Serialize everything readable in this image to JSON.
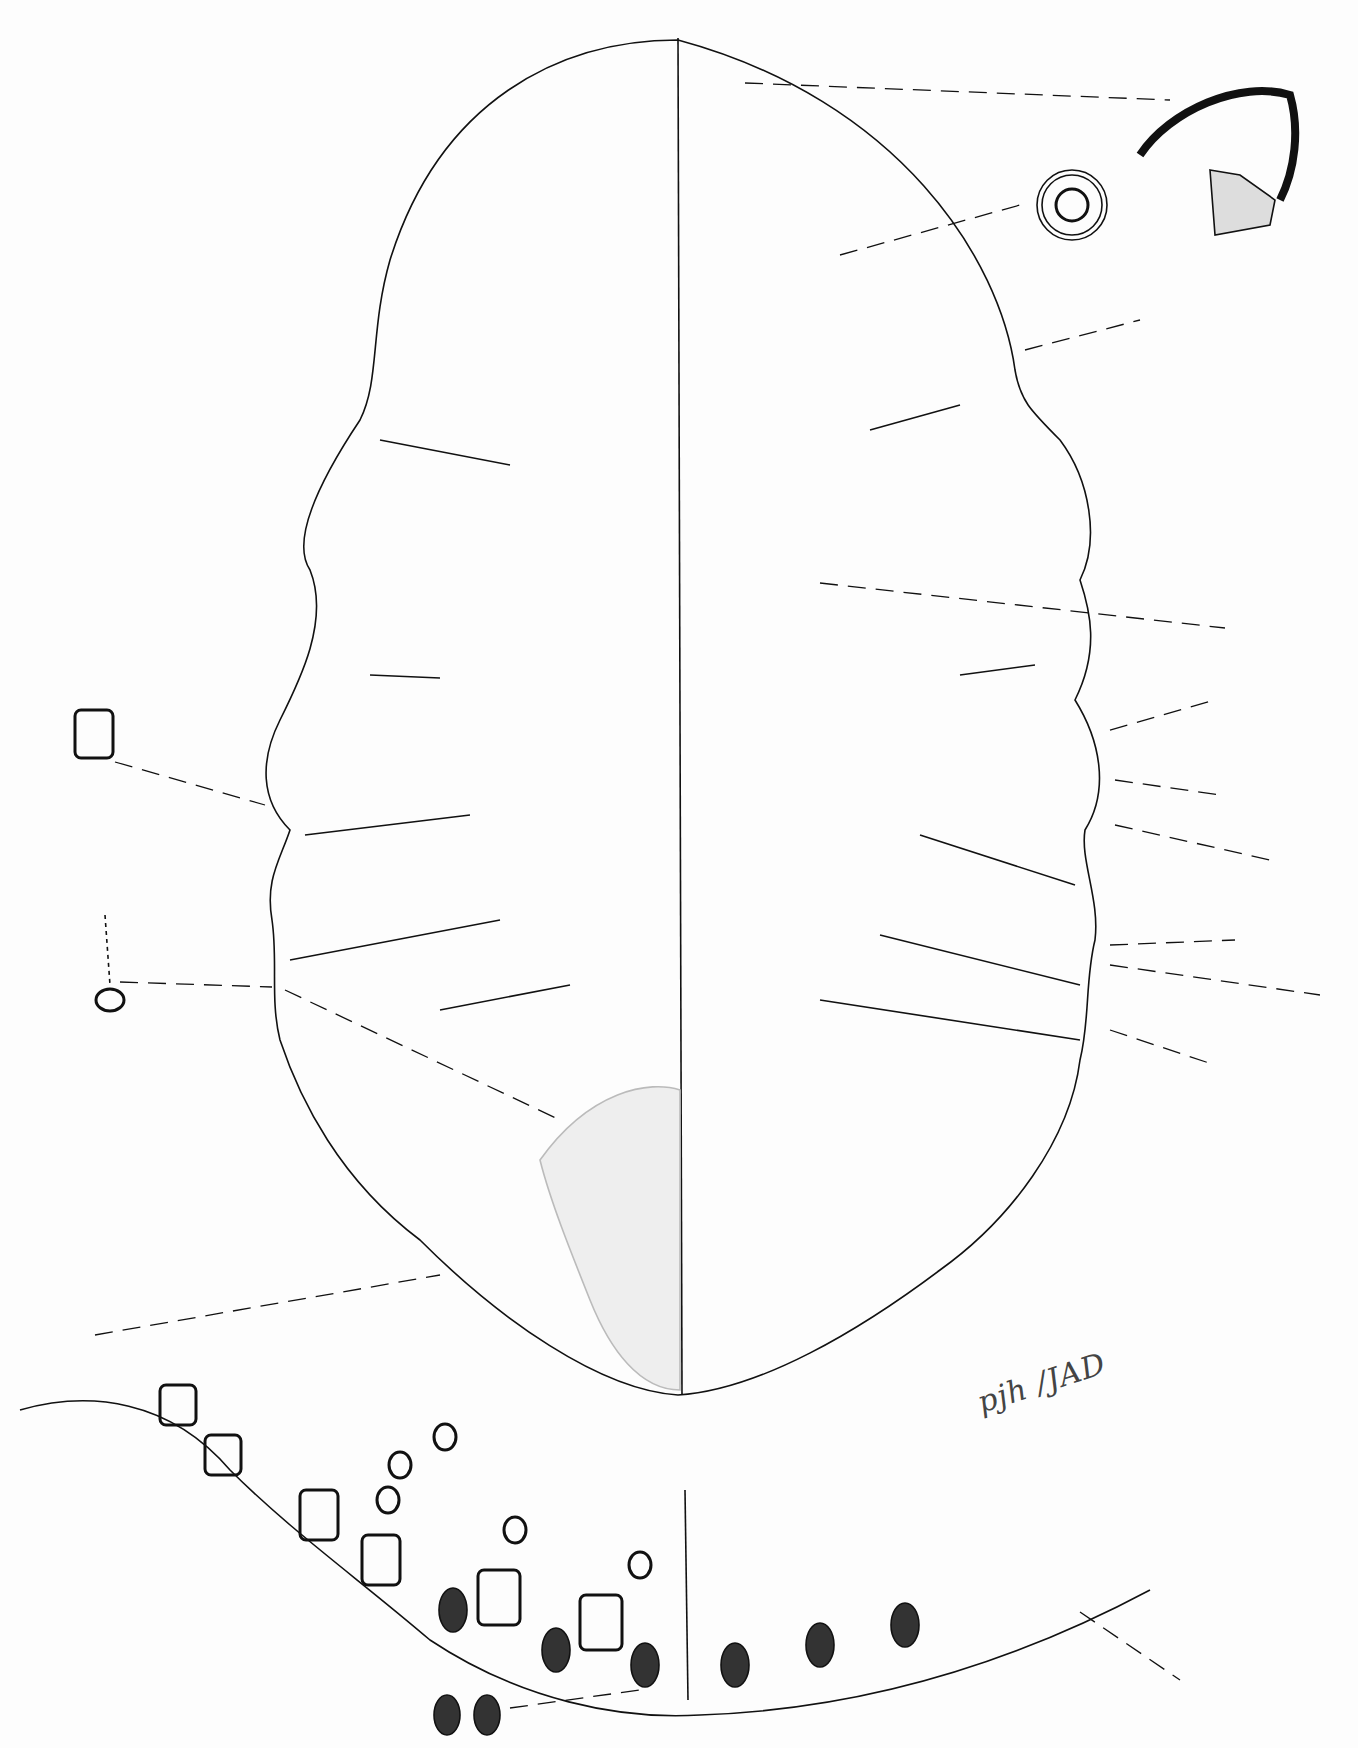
{
  "figure": {
    "signature": "pjh /JAD",
    "ink_color": "#111111",
    "paper_color": "#fdfdfd"
  }
}
